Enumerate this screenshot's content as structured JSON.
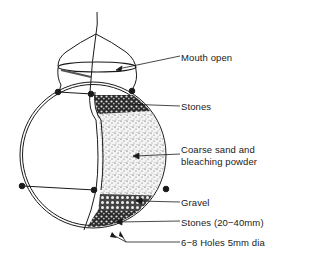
{
  "diagram": {
    "labels": [
      {
        "id": "mouth",
        "text": "Mouth open",
        "x": 181,
        "y": 52
      },
      {
        "id": "stones_top",
        "text": "Stones",
        "x": 181,
        "y": 101
      },
      {
        "id": "sand",
        "text": "Coarse sand and bleaching powder",
        "line1": "Coarse sand and",
        "line2": "bleaching powder",
        "x": 181,
        "y": 149
      },
      {
        "id": "gravel",
        "text": "Gravel",
        "x": 181,
        "y": 197
      },
      {
        "id": "stones_bottom",
        "text": "Stones (20−40mm)",
        "x": 181,
        "y": 217
      },
      {
        "id": "holes",
        "text": "6−8 Holes 5mm dia",
        "x": 181,
        "y": 237
      }
    ],
    "colors": {
      "line": "#1a1a1a",
      "background": "#ffffff",
      "sand": "#d8d8d8",
      "stones": "#3a3a3a"
    }
  }
}
